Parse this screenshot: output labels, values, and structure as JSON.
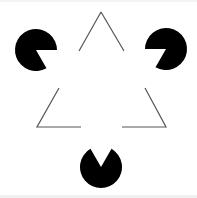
{
  "figure": {
    "title": "Kanizsa triangle illusion",
    "colors": {
      "background": "#ffffff",
      "inducer_fill": "#000000",
      "outline_stroke": "#555555",
      "band": "#f2f2f2"
    },
    "inducers": [
      {
        "name": "top-left-pacman",
        "cx": 36,
        "cy": 50,
        "r": 21,
        "mouth_start_deg": 0,
        "mouth_end_deg": 60
      },
      {
        "name": "top-right-pacman",
        "cx": 166,
        "cy": 49,
        "r": 21,
        "mouth_start_deg": 120,
        "mouth_end_deg": 180
      },
      {
        "name": "bottom-pacman",
        "cx": 101,
        "cy": 167,
        "r": 21,
        "mouth_start_deg": 240,
        "mouth_end_deg": 300
      }
    ],
    "outline_segments": [
      {
        "name": "apex-left-line",
        "points": "79,51 101,12"
      },
      {
        "name": "apex-right-line",
        "points": "101,12 124,51"
      },
      {
        "name": "bottom-left-corner",
        "points": "59,88 37,127 81,127"
      },
      {
        "name": "bottom-right-corner",
        "points": "145,88 166,127 122,127"
      }
    ]
  }
}
